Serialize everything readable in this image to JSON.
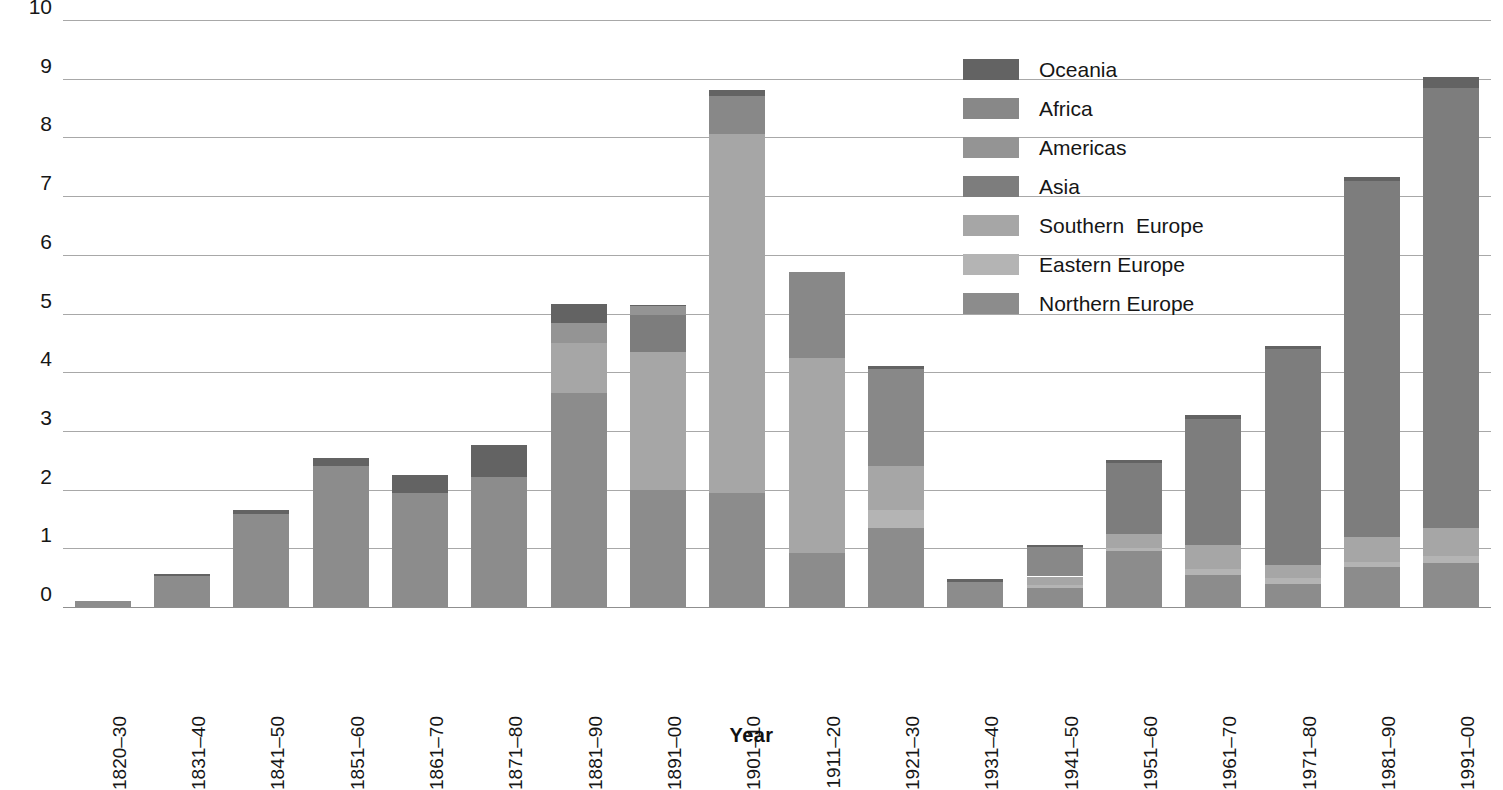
{
  "chart_data": {
    "type": "bar",
    "stacked": true,
    "title": "",
    "subtitle": "",
    "xlabel": "Year",
    "ylabel": "",
    "ylim": [
      0,
      10
    ],
    "ytick_labels": [
      "0",
      "1",
      "2",
      "3",
      "4",
      "5",
      "6",
      "7",
      "8",
      "9",
      "10"
    ],
    "ytick_values": [
      0,
      1,
      2,
      3,
      4,
      5,
      6,
      7,
      8,
      9,
      10
    ],
    "grid": true,
    "legend_position": "top-right",
    "categories": [
      "1820–30",
      "1831–40",
      "1841–50",
      "1851–60",
      "1861–70",
      "1871–80",
      "1881–90",
      "1891–00",
      "1901–10",
      "1911–20",
      "1921–30",
      "1931–40",
      "1941–50",
      "1951–60",
      "1961–70",
      "1971–80",
      "1981–90",
      "1991–00"
    ],
    "series": [
      {
        "name": "Northern Europe",
        "color": "#8c8c8c",
        "values": [
          0.1,
          0.52,
          1.58,
          2.4,
          1.95,
          2.22,
          3.65,
          2.0,
          1.95,
          0.92,
          1.35,
          0.42,
          0.32,
          0.95,
          0.55,
          0.4,
          0.68,
          0.75
        ]
      },
      {
        "name": "Eastern Europe",
        "color": "#b4b4b4",
        "values": [
          0.0,
          0.0,
          0.0,
          0.0,
          0.0,
          0.0,
          0.0,
          0.0,
          0.0,
          0.0,
          0.3,
          0.0,
          0.06,
          0.06,
          0.1,
          0.1,
          0.08,
          0.12
        ]
      },
      {
        "name": "Southern Europe",
        "color": "#a6a6a6",
        "values": [
          0.0,
          0.0,
          0.0,
          0.0,
          0.0,
          0.0,
          0.85,
          2.35,
          6.1,
          3.33,
          0.75,
          0.0,
          0.14,
          0.24,
          0.4,
          0.22,
          0.44,
          0.48
        ]
      },
      {
        "name": "Asia",
        "color": "#7d7d7d",
        "values": [
          0.0,
          0.0,
          0.0,
          0.0,
          0.0,
          0.0,
          0.0,
          0.62,
          0.0,
          0.0,
          0.0,
          0.0,
          0.0,
          1.2,
          2.15,
          3.68,
          6.05,
          7.5
        ]
      },
      {
        "name": "Americas",
        "color": "#949494",
        "values": [
          0.0,
          0.0,
          0.0,
          0.0,
          0.0,
          0.0,
          0.34,
          0.15,
          0.0,
          0.0,
          0.0,
          0.0,
          0.0,
          0.0,
          0.0,
          0.0,
          0.0,
          0.0
        ]
      },
      {
        "name": "Africa",
        "color": "#888888",
        "values": [
          0.0,
          0.0,
          0.0,
          0.0,
          0.0,
          0.0,
          0.0,
          0.0,
          0.65,
          1.45,
          1.65,
          0.0,
          0.5,
          0.0,
          0.0,
          0.0,
          0.0,
          0.0
        ]
      },
      {
        "name": "Oceania",
        "color": "#636363",
        "values": [
          0.0,
          0.05,
          0.08,
          0.14,
          0.3,
          0.54,
          0.32,
          0.03,
          0.1,
          0.0,
          0.05,
          0.06,
          0.04,
          0.06,
          0.07,
          0.05,
          0.08,
          0.18
        ]
      }
    ],
    "totals": [
      0.1,
      0.57,
      1.66,
      2.54,
      2.25,
      2.76,
      5.16,
      5.15,
      8.8,
      5.7,
      4.1,
      0.48,
      1.06,
      2.51,
      3.27,
      4.45,
      7.33,
      9.03
    ]
  },
  "legend": {
    "entries": [
      {
        "label": "Oceania",
        "color": "#636363"
      },
      {
        "label": "Africa",
        "color": "#888888"
      },
      {
        "label": "Americas",
        "color": "#949494"
      },
      {
        "label": "Asia",
        "color": "#7d7d7d"
      },
      {
        "label": "Southern  Europe",
        "color": "#a6a6a6"
      },
      {
        "label": "Eastern Europe",
        "color": "#b4b4b4"
      },
      {
        "label": "Northern Europe",
        "color": "#8c8c8c"
      }
    ]
  },
  "colors": {
    "gridline": "#a8a8a8",
    "background": "#ffffff",
    "text": "#161616"
  }
}
